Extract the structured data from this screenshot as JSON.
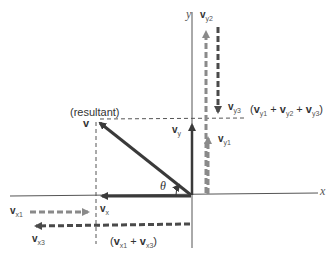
{
  "labels": {
    "resultant": "(resultant)",
    "v": "v",
    "v_x": "v",
    "v_x_sub": "x",
    "v_y": "v",
    "v_y_sub": "y",
    "theta": "θ",
    "axis_x": "x",
    "axis_y": "y",
    "v_y2": "v",
    "v_y2_sub": "y2",
    "v_y3": "v",
    "v_y3_sub": "y3",
    "v_y1": "v",
    "v_y1_sub": "y1",
    "v_x1": "v",
    "v_x1_sub": "x1",
    "v_x3": "v",
    "v_x3_sub": "x3",
    "sum_y": {
      "open": "(",
      "a": "v",
      "a_sub": "y1",
      "plus1": " + ",
      "b": "v",
      "b_sub": "y2",
      "plus2": " + ",
      "c": "v",
      "c_sub": "y3",
      "close": ")"
    },
    "sum_x": {
      "open": "(",
      "a": "v",
      "a_sub": "x1",
      "plus1": " + ",
      "b": "v",
      "b_sub": "x3",
      "close": ")"
    }
  },
  "colors": {
    "dark": "#3a3a3a",
    "gray": "#8a8a8a",
    "axis": "#555555"
  }
}
